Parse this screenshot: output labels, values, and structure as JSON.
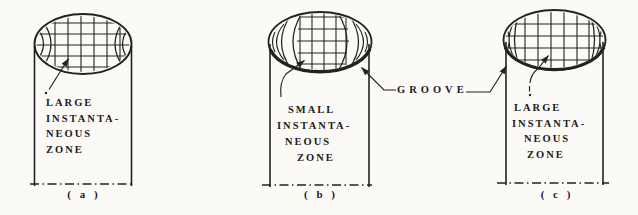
{
  "palette": {
    "paper": "#fbfaf7",
    "ink": "#222222",
    "text": "#1b1b1b"
  },
  "groove": {
    "label": "GROOVE"
  },
  "figures": [
    {
      "id": "a",
      "caption": "( a )",
      "zone_lines": [
        "LARGE",
        "INSTANTA-",
        "NEOUS",
        "ZONE"
      ]
    },
    {
      "id": "b",
      "caption": "( b )",
      "zone_lines": [
        "SMALL",
        "INSTANTA-",
        "NEOUS",
        "ZONE"
      ]
    },
    {
      "id": "c",
      "caption": "( c )",
      "zone_lines": [
        "LARGE",
        "INSTANTA-",
        "NEOUS",
        "ZONE"
      ]
    }
  ]
}
